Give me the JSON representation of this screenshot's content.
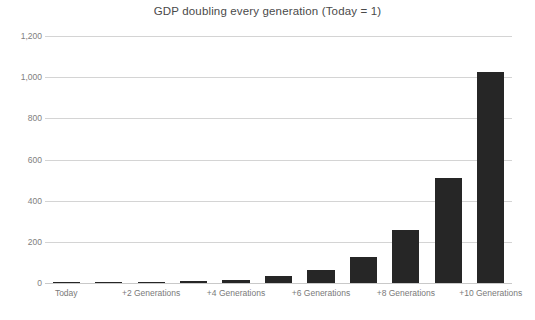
{
  "chart_data": {
    "type": "bar",
    "title": "GDP doubling every generation (Today = 1)",
    "xlabel": "",
    "ylabel": "",
    "ylim": [
      0,
      1200
    ],
    "yticks": [
      0,
      200,
      400,
      600,
      800,
      1000,
      1200
    ],
    "ytick_labels": [
      "0",
      "200",
      "400",
      "600",
      "800",
      "1,000",
      "1,200"
    ],
    "grid": true,
    "legend": false,
    "legend_position": "none",
    "categories": [
      "Today",
      "+1 Generation",
      "+2 Generations",
      "+3 Generations",
      "+4 Generations",
      "+5 Generations",
      "+6 Generations",
      "+7 Generations",
      "+8 Generations",
      "+9 Generations",
      "+10 Generations"
    ],
    "xtick_labels_visible": [
      "Today",
      "+2 Generations",
      "+4 Generations",
      "+6 Generations",
      "+8 Generations",
      "+10 Generations"
    ],
    "values": [
      1,
      2,
      4,
      8,
      16,
      32,
      64,
      128,
      256,
      512,
      1024
    ],
    "series": [
      {
        "name": "GDP",
        "values": [
          1,
          2,
          4,
          8,
          16,
          32,
          64,
          128,
          256,
          512,
          1024
        ]
      }
    ],
    "bar_color": "#262626",
    "gridline_color": "#d4d4d4",
    "title_color": "#4a4a4a",
    "tick_label_color": "#7a7a7a",
    "background_color": "#ffffff"
  }
}
